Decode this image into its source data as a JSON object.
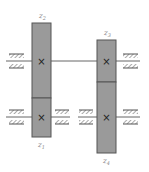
{
  "diagram": {
    "type": "gear-train-schematic",
    "colors": {
      "gear_fill": "#9a9a9a",
      "gear_stroke": "#555555",
      "shaft": "#666666",
      "bearing": "#555555",
      "label": "#888888"
    },
    "gears": [
      {
        "id": "z1",
        "label": "z",
        "subscript": "1",
        "shaft": "lower",
        "column": "left"
      },
      {
        "id": "z2",
        "label": "z",
        "subscript": "2",
        "shaft": "upper",
        "column": "left"
      },
      {
        "id": "z3",
        "label": "z",
        "subscript": "3",
        "shaft": "upper",
        "column": "right"
      },
      {
        "id": "z4",
        "label": "z",
        "subscript": "4",
        "shaft": "lower",
        "column": "right"
      }
    ],
    "shafts": [
      {
        "id": "upper",
        "bearings": 2
      },
      {
        "id": "lower-left",
        "bearings": 2
      },
      {
        "id": "lower-right",
        "bearings": 2
      }
    ],
    "axle_marker": "×"
  }
}
